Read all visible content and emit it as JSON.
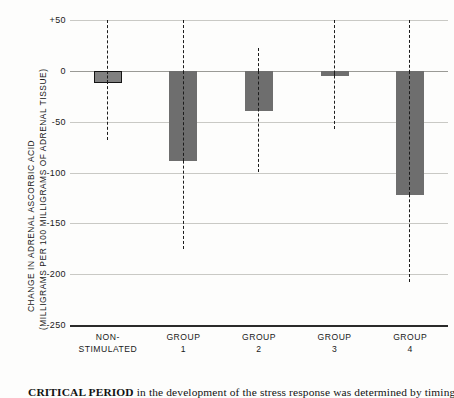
{
  "chart_data": {
    "type": "bar",
    "title": "",
    "xlabel": "",
    "ylabel": "CHANGE IN ADRENAL ASCORBIC ACID (MILLIGRAMS PER 100 MILLIGRAMS OF ADRENAL TISSUE)",
    "ylabel_lines": [
      "CHANGE IN ADRENAL ASCORBIC ACID",
      "(MILLIGRAMS PER 100 MILLIGRAMS OF ADRENAL TISSUE)"
    ],
    "ylim": [
      -250,
      50
    ],
    "yticks": [
      50,
      0,
      -50,
      -100,
      -150,
      -200,
      -250
    ],
    "ytick_labels": [
      "+50",
      "0",
      "-50",
      "-100",
      "-150",
      "-200",
      "-250"
    ],
    "grid": true,
    "legend": "none",
    "categories": [
      "NON-STIMULATED",
      "GROUP 1",
      "GROUP 2",
      "GROUP 3",
      "GROUP 4"
    ],
    "category_lines": [
      [
        "NON-",
        "STIMULATED"
      ],
      [
        "GROUP",
        "1"
      ],
      [
        "GROUP",
        "2"
      ],
      [
        "GROUP",
        "3"
      ],
      [
        "GROUP",
        "4"
      ]
    ],
    "values": [
      -12,
      -89,
      -40,
      -5,
      -122
    ],
    "error_bars": [
      {
        "category": "NON-STIMULATED",
        "upper": 50,
        "lower": -68
      },
      {
        "category": "GROUP 1",
        "upper": 50,
        "lower": -175
      },
      {
        "category": "GROUP 2",
        "upper": 22,
        "lower": -100
      },
      {
        "category": "GROUP 3",
        "upper": 50,
        "lower": -57
      },
      {
        "category": "GROUP 4",
        "upper": 50,
        "lower": -208
      }
    ],
    "bar_fill_color": "#6e6e6e",
    "bar_outline_color": "#141414",
    "grid_color": "#c9c9c5",
    "axis_color": "#2a2a2a"
  },
  "caption": {
    "lead": "CRITICAL PERIOD",
    "rest": " in the development of the stress response was determined by timing"
  }
}
